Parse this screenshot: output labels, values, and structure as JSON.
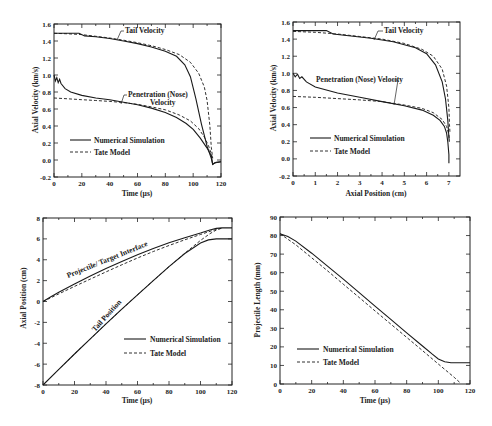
{
  "chart_data": [
    {
      "id": "vel_time",
      "type": "line",
      "title": "",
      "xlabel": "Time  (µs)",
      "ylabel": "Axial Velocity (km/s)",
      "xlim": [
        0,
        120
      ],
      "ylim": [
        -0.2,
        1.6
      ],
      "xticks": [
        0,
        20,
        40,
        60,
        80,
        100,
        120
      ],
      "yticks": [
        -0.2,
        0.0,
        0.2,
        0.4,
        0.6,
        0.8,
        1.0,
        1.2,
        1.4,
        1.6
      ],
      "ytick_labels": [
        "-0.2",
        "0.0",
        "0.2",
        "0.4",
        "0.6",
        "0.8",
        "1.0",
        "1.2",
        "1.4",
        "1.6"
      ],
      "grid": false,
      "legend": {
        "position": "lower-left",
        "entries": [
          "Numerical Simulation",
          "Tate Model"
        ]
      },
      "annotations": [
        "Tail Velocity",
        "Penetration (Nose)",
        "Velocity"
      ],
      "frame": {
        "left": 54,
        "right": 221,
        "top": 24,
        "bottom": 177
      },
      "series": [
        {
          "name": "Tail Velocity - Numerical Simulation",
          "style": "solid",
          "x": [
            0,
            10,
            18,
            22,
            30,
            40,
            50,
            60,
            70,
            80,
            88,
            94,
            98,
            102,
            106,
            110,
            113,
            114,
            116,
            120
          ],
          "y": [
            1.49,
            1.49,
            1.49,
            1.46,
            1.45,
            1.43,
            1.4,
            1.37,
            1.33,
            1.28,
            1.22,
            1.12,
            0.98,
            0.72,
            0.42,
            0.16,
            0.02,
            -0.05,
            -0.03,
            -0.02
          ]
        },
        {
          "name": "Tail Velocity - Tate Model",
          "style": "dashed",
          "x": [
            0,
            10,
            20,
            30,
            40,
            50,
            60,
            70,
            80,
            90,
            98,
            104,
            108,
            110,
            112,
            113,
            114
          ],
          "y": [
            1.49,
            1.485,
            1.475,
            1.455,
            1.435,
            1.41,
            1.38,
            1.345,
            1.3,
            1.24,
            1.15,
            1.02,
            0.86,
            0.7,
            0.4,
            0.15,
            0.02
          ]
        },
        {
          "name": "Nose Velocity - Numerical Simulation",
          "style": "solid",
          "x": [
            0,
            1,
            2,
            3,
            4,
            5,
            8,
            12,
            20,
            30,
            40,
            50,
            60,
            70,
            80,
            88,
            95,
            100,
            105,
            110,
            113,
            114,
            116,
            120
          ],
          "y": [
            1.0,
            0.93,
            0.97,
            0.91,
            0.95,
            0.9,
            0.84,
            0.8,
            0.76,
            0.73,
            0.71,
            0.68,
            0.65,
            0.61,
            0.56,
            0.5,
            0.43,
            0.36,
            0.26,
            0.14,
            0.05,
            -0.05,
            -0.03,
            -0.02
          ]
        },
        {
          "name": "Nose Velocity - Tate Model",
          "style": "dashed",
          "x": [
            0,
            10,
            20,
            30,
            40,
            50,
            60,
            70,
            80,
            90,
            98,
            104,
            108,
            111,
            113,
            114
          ],
          "y": [
            0.73,
            0.72,
            0.71,
            0.7,
            0.69,
            0.675,
            0.655,
            0.625,
            0.59,
            0.53,
            0.46,
            0.37,
            0.27,
            0.17,
            0.07,
            0.02
          ]
        }
      ]
    },
    {
      "id": "vel_position",
      "type": "line",
      "title": "",
      "xlabel": "Axial Position (cm)",
      "ylabel": "Axial Velocity (km/s)",
      "xlim": [
        0,
        7.5
      ],
      "ylim": [
        -0.2,
        1.6
      ],
      "xticks": [
        0,
        1,
        2,
        3,
        4,
        5,
        6,
        7
      ],
      "yticks": [
        -0.2,
        0.0,
        0.2,
        0.4,
        0.6,
        0.8,
        1.0,
        1.2,
        1.4,
        1.6
      ],
      "ytick_labels": [
        "-0.2",
        "0.0",
        "0.2",
        "0.4",
        "0.6",
        "0.8",
        "1.0",
        "1.2",
        "1.4",
        "1.6"
      ],
      "grid": false,
      "legend": {
        "position": "lower-left",
        "entries": [
          "Numerical Simulation",
          "Tate Model"
        ]
      },
      "annotations": [
        "Tail Velocity",
        "Penetration (Nose) Velocity"
      ],
      "frame": {
        "left": 293,
        "right": 460,
        "top": 22,
        "bottom": 176
      },
      "series": [
        {
          "name": "Tail Velocity - Numerical Simulation",
          "style": "solid",
          "x": [
            0,
            1.0,
            1.5,
            1.8,
            2.5,
            3.5,
            4.5,
            5.5,
            6.0,
            6.4,
            6.7,
            6.85,
            6.95,
            7.0,
            7.02
          ],
          "y": [
            1.5,
            1.5,
            1.5,
            1.46,
            1.44,
            1.41,
            1.37,
            1.3,
            1.23,
            1.1,
            0.9,
            0.7,
            0.45,
            0.25,
            0.2
          ]
        },
        {
          "name": "Tail Velocity - Tate Model",
          "style": "dashed",
          "x": [
            0,
            1.0,
            2.0,
            3.0,
            4.0,
            5.0,
            5.8,
            6.3,
            6.7,
            6.9,
            7.0,
            7.03,
            7.05
          ],
          "y": [
            1.49,
            1.48,
            1.46,
            1.43,
            1.4,
            1.35,
            1.28,
            1.2,
            1.05,
            0.85,
            0.6,
            0.4,
            0.3
          ]
        },
        {
          "name": "Nose Velocity - Numerical Simulation",
          "style": "solid",
          "x": [
            0,
            0.1,
            0.2,
            0.3,
            0.4,
            0.6,
            1.0,
            2.0,
            3.0,
            4.0,
            5.0,
            5.8,
            6.3,
            6.6,
            6.8,
            6.9,
            6.95,
            7.0,
            7.0
          ],
          "y": [
            1.0,
            0.96,
            0.99,
            0.94,
            0.96,
            0.9,
            0.84,
            0.77,
            0.72,
            0.67,
            0.62,
            0.57,
            0.51,
            0.45,
            0.38,
            0.3,
            0.2,
            0.05,
            -0.05
          ]
        },
        {
          "name": "Nose Velocity - Tate Model",
          "style": "dashed",
          "x": [
            0,
            1.0,
            2.0,
            3.0,
            4.0,
            5.0,
            5.8,
            6.3,
            6.7,
            6.9,
            7.0,
            7.03
          ],
          "y": [
            0.73,
            0.72,
            0.705,
            0.69,
            0.67,
            0.63,
            0.59,
            0.54,
            0.46,
            0.38,
            0.28,
            0.22
          ]
        }
      ]
    },
    {
      "id": "position_time",
      "type": "line",
      "title": "",
      "xlabel": "Time  (µs)",
      "ylabel": "Axial Position (cm)",
      "xlim": [
        0,
        120
      ],
      "ylim": [
        -8,
        8
      ],
      "xticks": [
        0,
        20,
        40,
        60,
        80,
        100,
        120
      ],
      "yticks": [
        -8,
        -6,
        -4,
        -2,
        0,
        2,
        4,
        6,
        8
      ],
      "ytick_labels": [
        "-8",
        "-6",
        "-4",
        "-2",
        "0",
        "2",
        "4",
        "6",
        "8"
      ],
      "grid": false,
      "legend": {
        "position": "lower-right",
        "entries": [
          "Numerical Simulation",
          "Tate Model"
        ]
      },
      "annotations": [
        "Projectile/ Target  Interface",
        "Tail Position"
      ],
      "frame": {
        "left": 43,
        "right": 232,
        "top": 218,
        "bottom": 385
      },
      "series": [
        {
          "name": "Interface - Numerical Simulation",
          "style": "solid",
          "x": [
            0,
            5,
            10,
            20,
            30,
            40,
            50,
            60,
            70,
            80,
            90,
            100,
            106,
            110,
            114,
            120
          ],
          "y": [
            0,
            0.45,
            0.88,
            1.68,
            2.44,
            3.16,
            3.84,
            4.48,
            5.08,
            5.62,
            6.1,
            6.55,
            6.85,
            7.0,
            7.05,
            7.05
          ]
        },
        {
          "name": "Interface - Tate Model",
          "style": "dashed",
          "x": [
            0,
            10,
            20,
            30,
            40,
            50,
            60,
            70,
            80,
            90,
            100,
            108,
            114
          ],
          "y": [
            0,
            0.73,
            1.45,
            2.15,
            2.84,
            3.52,
            4.17,
            4.79,
            5.37,
            5.91,
            6.42,
            6.82,
            7.05
          ]
        },
        {
          "name": "Tail - Numerical Simulation",
          "style": "solid",
          "x": [
            0,
            10,
            20,
            30,
            40,
            50,
            60,
            70,
            80,
            90,
            100,
            105,
            110,
            114,
            120
          ],
          "y": [
            -8,
            -6.5,
            -5.03,
            -3.58,
            -2.15,
            -0.74,
            0.64,
            2.0,
            3.33,
            4.6,
            5.6,
            5.9,
            6.0,
            6.0,
            6.0
          ]
        },
        {
          "name": "Tail - Tate Model",
          "style": "dashed",
          "x": [
            0,
            10,
            20,
            30,
            40,
            50,
            60,
            70,
            80,
            90,
            100,
            106,
            110,
            114
          ],
          "y": [
            -8,
            -6.5,
            -5.03,
            -3.58,
            -2.15,
            -0.74,
            0.64,
            2.0,
            3.33,
            4.62,
            5.85,
            6.5,
            6.85,
            7.05
          ]
        }
      ]
    },
    {
      "id": "length_time",
      "type": "line",
      "title": "",
      "xlabel": "Time  (µs)",
      "ylabel": "Projectile Length (mm)",
      "xlim": [
        0,
        120
      ],
      "ylim": [
        0,
        90
      ],
      "xticks": [
        0,
        20,
        40,
        60,
        80,
        100,
        120
      ],
      "yticks": [
        0,
        10,
        20,
        30,
        40,
        50,
        60,
        70,
        80,
        90
      ],
      "ytick_labels": [
        "0",
        "10",
        "20",
        "30",
        "40",
        "50",
        "60",
        "70",
        "80",
        "90"
      ],
      "grid": false,
      "legend": {
        "position": "lower-left",
        "entries": [
          "Numerical Simulation",
          "Tate Model"
        ]
      },
      "annotations": [],
      "frame": {
        "left": 280,
        "right": 470,
        "top": 217,
        "bottom": 384
      },
      "series": [
        {
          "name": "Numerical Simulation",
          "style": "solid",
          "x": [
            0,
            5,
            10,
            20,
            30,
            40,
            50,
            60,
            70,
            80,
            90,
            96,
            100,
            104,
            108,
            120
          ],
          "y": [
            81,
            79.5,
            77,
            70.5,
            63.5,
            56.5,
            49.2,
            42,
            34.8,
            27.6,
            20.5,
            16.2,
            13.5,
            12,
            11.5,
            11.5
          ]
        },
        {
          "name": "Tate Model",
          "style": "dashed",
          "x": [
            0,
            10,
            20,
            30,
            40,
            50,
            60,
            70,
            80,
            90,
            100,
            110,
            114
          ],
          "y": [
            81,
            75,
            68,
            61,
            53.8,
            46.6,
            39.4,
            32.3,
            25.1,
            18,
            10.8,
            3.6,
            0.5
          ]
        }
      ]
    }
  ],
  "labels": {
    "chart1": {
      "xlabel": "Time  (µs)",
      "ylabel": "Axial Velocity (km/s)",
      "ann_tail": "Tail Velocity",
      "ann_nose1": "Penetration (Nose)",
      "ann_nose2": "Velocity",
      "legend_solid": "Numerical Simulation",
      "legend_dash": "Tate Model"
    },
    "chart2": {
      "xlabel": "Axial Position (cm)",
      "ylabel": "Axial Velocity (km/s)",
      "ann_tail": "Tail Velocity",
      "ann_nose": "Penetration (Nose) Velocity",
      "legend_solid": "Numerical Simulation",
      "legend_dash": "Tate Model"
    },
    "chart3": {
      "xlabel": "Time  (µs)",
      "ylabel": "Axial Position (cm)",
      "ann_interface": "Projectile/ Target  Interface",
      "ann_tail": "Tail Position",
      "legend_solid": "Numerical Simulation",
      "legend_dash": "Tate Model"
    },
    "chart4": {
      "xlabel": "Time  (µs)",
      "ylabel": "Projectile Length (mm)",
      "legend_solid": "Numerical Simulation",
      "legend_dash": "Tate Model"
    }
  }
}
